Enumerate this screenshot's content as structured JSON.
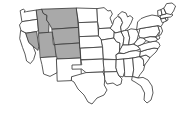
{
  "map": {
    "title": "United States map with selected western states highlighted",
    "background_color": "#ffffff",
    "outline_color": "#3d3d3d",
    "highlight_color": "#a9a9a9",
    "default_fill_color": "#ffffff",
    "projection_note": "contiguous United States only",
    "labels_visible": false,
    "legend_visible": false,
    "highlighted_count": "6",
    "highlighted_states": [
      "Montana",
      "Idaho",
      "Wyoming",
      "Nevada",
      "Utah",
      "Colorado"
    ],
    "states": [
      {
        "code": "WA",
        "name": "Washington",
        "highlighted": false
      },
      {
        "code": "OR",
        "name": "Oregon",
        "highlighted": false
      },
      {
        "code": "CA",
        "name": "California",
        "highlighted": false
      },
      {
        "code": "NV",
        "name": "Nevada",
        "highlighted": true
      },
      {
        "code": "ID",
        "name": "Idaho",
        "highlighted": true
      },
      {
        "code": "MT",
        "name": "Montana",
        "highlighted": true
      },
      {
        "code": "WY",
        "name": "Wyoming",
        "highlighted": true
      },
      {
        "code": "UT",
        "name": "Utah",
        "highlighted": true
      },
      {
        "code": "CO",
        "name": "Colorado",
        "highlighted": true
      },
      {
        "code": "AZ",
        "name": "Arizona",
        "highlighted": false
      },
      {
        "code": "NM",
        "name": "New Mexico",
        "highlighted": false
      },
      {
        "code": "ND",
        "name": "North Dakota",
        "highlighted": false
      },
      {
        "code": "SD",
        "name": "South Dakota",
        "highlighted": false
      },
      {
        "code": "NE",
        "name": "Nebraska",
        "highlighted": false
      },
      {
        "code": "KS",
        "name": "Kansas",
        "highlighted": false
      },
      {
        "code": "OK",
        "name": "Oklahoma",
        "highlighted": false
      },
      {
        "code": "TX",
        "name": "Texas",
        "highlighted": false
      },
      {
        "code": "MN",
        "name": "Minnesota",
        "highlighted": false
      },
      {
        "code": "IA",
        "name": "Iowa",
        "highlighted": false
      },
      {
        "code": "MO",
        "name": "Missouri",
        "highlighted": false
      },
      {
        "code": "AR",
        "name": "Arkansas",
        "highlighted": false
      },
      {
        "code": "LA",
        "name": "Louisiana",
        "highlighted": false
      },
      {
        "code": "WI",
        "name": "Wisconsin",
        "highlighted": false
      },
      {
        "code": "IL",
        "name": "Illinois",
        "highlighted": false
      },
      {
        "code": "MI",
        "name": "Michigan",
        "highlighted": false
      },
      {
        "code": "IN",
        "name": "Indiana",
        "highlighted": false
      },
      {
        "code": "OH",
        "name": "Ohio",
        "highlighted": false
      },
      {
        "code": "KY",
        "name": "Kentucky",
        "highlighted": false
      },
      {
        "code": "TN",
        "name": "Tennessee",
        "highlighted": false
      },
      {
        "code": "MS",
        "name": "Mississippi",
        "highlighted": false
      },
      {
        "code": "AL",
        "name": "Alabama",
        "highlighted": false
      },
      {
        "code": "GA",
        "name": "Georgia",
        "highlighted": false
      },
      {
        "code": "FL",
        "name": "Florida",
        "highlighted": false
      },
      {
        "code": "SC",
        "name": "South Carolina",
        "highlighted": false
      },
      {
        "code": "NC",
        "name": "North Carolina",
        "highlighted": false
      },
      {
        "code": "VA",
        "name": "Virginia",
        "highlighted": false
      },
      {
        "code": "WV",
        "name": "West Virginia",
        "highlighted": false
      },
      {
        "code": "MD",
        "name": "Maryland",
        "highlighted": false
      },
      {
        "code": "DE",
        "name": "Delaware",
        "highlighted": false
      },
      {
        "code": "PA",
        "name": "Pennsylvania",
        "highlighted": false
      },
      {
        "code": "NJ",
        "name": "New Jersey",
        "highlighted": false
      },
      {
        "code": "NY",
        "name": "New York",
        "highlighted": false
      },
      {
        "code": "CT",
        "name": "Connecticut",
        "highlighted": false
      },
      {
        "code": "RI",
        "name": "Rhode Island",
        "highlighted": false
      },
      {
        "code": "MA",
        "name": "Massachusetts",
        "highlighted": false
      },
      {
        "code": "VT",
        "name": "Vermont",
        "highlighted": false
      },
      {
        "code": "NH",
        "name": "New Hampshire",
        "highlighted": false
      },
      {
        "code": "ME",
        "name": "Maine",
        "highlighted": false
      }
    ]
  }
}
